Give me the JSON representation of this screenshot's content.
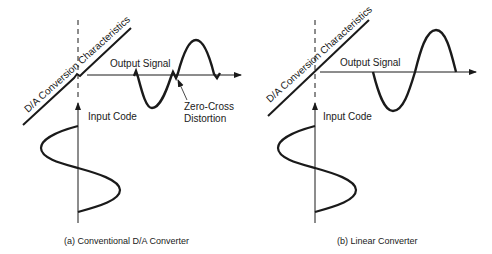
{
  "panels": [
    {
      "id": "a",
      "characteristic_label": "D/A Conversion Characteristics",
      "output_label": "Output Signal",
      "input_label": "Input Code",
      "annotation_label_line1": "Zero-Cross",
      "annotation_label_line2": "Distortion",
      "caption": "(a)  Conventional D/A Converter"
    },
    {
      "id": "b",
      "characteristic_label": "D/A Conversion Characteristics",
      "output_label": "Output Signal",
      "input_label": "Input Code",
      "caption": "(b)  Linear Converter"
    }
  ],
  "colors": {
    "ink": "#1a1a1a",
    "background": "#ffffff"
  }
}
